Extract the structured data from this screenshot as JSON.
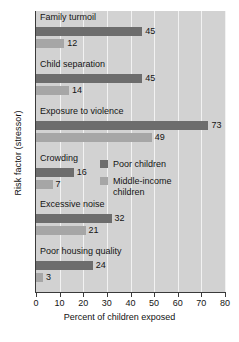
{
  "chart_data": {
    "type": "bar",
    "orientation": "horizontal",
    "title": "",
    "xlabel": "Percent of children exposed",
    "ylabel": "Risk factor (stressor)",
    "xlim": [
      0,
      80
    ],
    "xticks": [
      0,
      10,
      20,
      30,
      40,
      50,
      60,
      70,
      80
    ],
    "grid": true,
    "grid_axis": "x",
    "legend_position": "center-right-inside",
    "categories": [
      "Family turmoil",
      "Child separation",
      "Exposure to violence",
      "Crowding",
      "Excessive noise",
      "Poor housing quality"
    ],
    "series": [
      {
        "name": "Poor children",
        "color": "#6d6d6d",
        "values": [
          45,
          45,
          73,
          16,
          32,
          24
        ]
      },
      {
        "name": "Middle-income children",
        "color": "#a6a6a6",
        "values": [
          12,
          14,
          49,
          7,
          21,
          3
        ]
      }
    ]
  },
  "legend": {
    "items": [
      {
        "label": "Poor children",
        "color": "#6d6d6d"
      },
      {
        "label": "Middle-income\nchildren",
        "color": "#a6a6a6"
      }
    ]
  },
  "colors": {
    "plot_background": "#d2d2d2",
    "gridline": "#f2f2f2",
    "axis": "#3a3a3a",
    "poor": "#6d6d6d",
    "middle": "#a6a6a6",
    "text": "#141414"
  }
}
